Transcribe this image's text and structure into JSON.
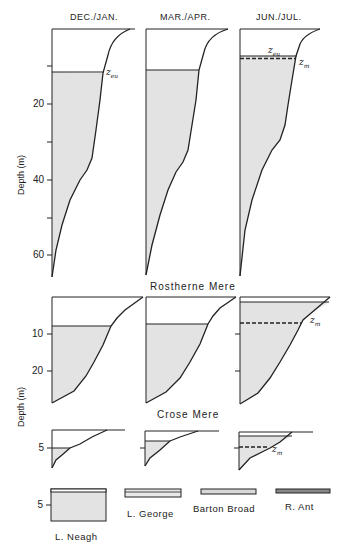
{
  "figure": {
    "columns": [
      "DEC./JAN.",
      "MAR./APR.",
      "JUN./JUL."
    ],
    "axis_title": "Depth (m)",
    "colors": {
      "fill": "#e3e3e3",
      "line": "#222222",
      "background": "#ffffff"
    }
  },
  "rostherne": {
    "name": "Rostherne Mere",
    "ticks": [
      "20",
      "40",
      "60"
    ],
    "labels": {
      "zeu": "z",
      "zeu_sub": "eu",
      "zm": "z",
      "zm_sub": "m"
    }
  },
  "crose": {
    "name": "Crose Mere",
    "ticks": [
      "10",
      "20"
    ],
    "labels": {
      "zm": "z",
      "zm_sub": "m"
    }
  },
  "shallow": {
    "tick": "5",
    "labels": {
      "zm": "z",
      "zm_sub": "m"
    }
  },
  "lakes": {
    "tick": "5",
    "items": [
      "L. Neagh",
      "L. George",
      "Barton Broad",
      "R. Ant"
    ]
  }
}
